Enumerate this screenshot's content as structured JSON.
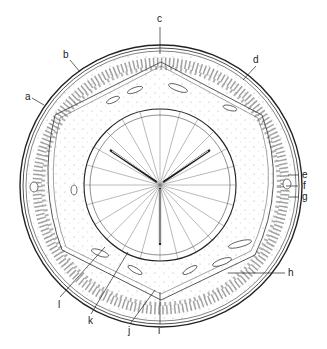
{
  "diagram": {
    "type": "cross-section illustration",
    "labels": [
      {
        "id": "a",
        "text": "a",
        "x": 25,
        "y": 97
      },
      {
        "id": "b",
        "text": "b",
        "x": 63,
        "y": 54
      },
      {
        "id": "c",
        "text": "c",
        "x": 157,
        "y": 17
      },
      {
        "id": "d",
        "text": "d",
        "x": 254,
        "y": 57
      },
      {
        "id": "e",
        "text": "e",
        "x": 302,
        "y": 171
      },
      {
        "id": "f",
        "text": "f",
        "x": 302,
        "y": 182
      },
      {
        "id": "g",
        "text": "g",
        "x": 302,
        "y": 194
      },
      {
        "id": "h",
        "text": "h",
        "x": 287,
        "y": 270
      },
      {
        "id": "i",
        "text": "i",
        "x": 159,
        "y": 326
      },
      {
        "id": "j",
        "text": "j",
        "x": 128,
        "y": 326
      },
      {
        "id": "k",
        "text": "k",
        "x": 88,
        "y": 317
      },
      {
        "id": "l",
        "text": "l",
        "x": 57,
        "y": 300
      }
    ],
    "colors": {
      "line": "#222222",
      "stipple": "#999999",
      "background": "#ffffff"
    }
  }
}
